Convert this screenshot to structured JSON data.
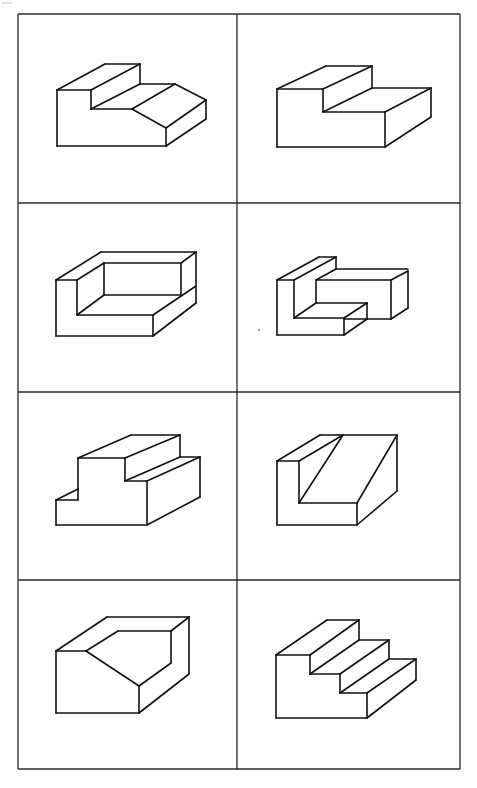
{
  "figure": {
    "type": "isometric-block-drawings-grid",
    "rows": 4,
    "columns": 2,
    "line_color": "#111111",
    "border_color": "#2a2a2a",
    "background": "#ffffff",
    "border": {
      "x1": 18,
      "y1": 14,
      "x2": 460,
      "y2": 769
    },
    "column_divider_x": 237,
    "row_divider_y": [
      203,
      392,
      580
    ]
  },
  "cells": [
    {
      "id": 1,
      "row": 1,
      "col": 1,
      "label": "stepped block with sloped front",
      "edges": [
        [
          57,
          90,
          57,
          146
        ],
        [
          57,
          146,
          166,
          146
        ],
        [
          57,
          90,
          91,
          90
        ],
        [
          91,
          90,
          91,
          109
        ],
        [
          91,
          109,
          132,
          109
        ],
        [
          132,
          109,
          166,
          128
        ],
        [
          166,
          128,
          166,
          146
        ],
        [
          57,
          90,
          105,
          64
        ],
        [
          105,
          64,
          140,
          64
        ],
        [
          91,
          90,
          140,
          64
        ],
        [
          140,
          64,
          140,
          84
        ],
        [
          91,
          109,
          140,
          84
        ],
        [
          140,
          84,
          175,
          84
        ],
        [
          132,
          109,
          175,
          84
        ],
        [
          175,
          84,
          206,
          100
        ],
        [
          166,
          128,
          206,
          100
        ],
        [
          206,
          100,
          206,
          119
        ],
        [
          166,
          146,
          206,
          119
        ]
      ]
    },
    {
      "id": 2,
      "row": 1,
      "col": 2,
      "label": "L-step block",
      "edges": [
        [
          277,
          89,
          277,
          147
        ],
        [
          277,
          147,
          385,
          147
        ],
        [
          277,
          89,
          323,
          89
        ],
        [
          323,
          89,
          323,
          112
        ],
        [
          323,
          112,
          385,
          112
        ],
        [
          385,
          112,
          385,
          147
        ],
        [
          277,
          89,
          326,
          66
        ],
        [
          326,
          66,
          372,
          66
        ],
        [
          323,
          89,
          372,
          66
        ],
        [
          372,
          66,
          372,
          88
        ],
        [
          323,
          112,
          372,
          88
        ],
        [
          372,
          88,
          431,
          88
        ],
        [
          385,
          112,
          431,
          88
        ],
        [
          431,
          88,
          431,
          117
        ],
        [
          385,
          147,
          431,
          117
        ]
      ]
    },
    {
      "id": 3,
      "row": 2,
      "col": 1,
      "label": "open box corner",
      "edges": [
        [
          56,
          280,
          56,
          336
        ],
        [
          56,
          336,
          153,
          336
        ],
        [
          56,
          280,
          77,
          280
        ],
        [
          77,
          280,
          77,
          315
        ],
        [
          77,
          315,
          153,
          315
        ],
        [
          153,
          315,
          153,
          336
        ],
        [
          56,
          280,
          101,
          252
        ],
        [
          101,
          252,
          196,
          252
        ],
        [
          77,
          280,
          104,
          263
        ],
        [
          104,
          263,
          181,
          263
        ],
        [
          104,
          263,
          104,
          295
        ],
        [
          77,
          315,
          104,
          295
        ],
        [
          104,
          295,
          181,
          295
        ],
        [
          181,
          263,
          181,
          295
        ],
        [
          181,
          263,
          196,
          252
        ],
        [
          153,
          315,
          196,
          286
        ],
        [
          196,
          252,
          196,
          303
        ],
        [
          153,
          336,
          196,
          303
        ]
      ]
    },
    {
      "id": 4,
      "row": 2,
      "col": 2,
      "label": "L-shaped interlocking block",
      "edges": [
        [
          277,
          280,
          277,
          335
        ],
        [
          277,
          335,
          344,
          335
        ],
        [
          277,
          280,
          294,
          280
        ],
        [
          294,
          280,
          294,
          318
        ],
        [
          294,
          318,
          344,
          318
        ],
        [
          344,
          318,
          344,
          335
        ],
        [
          277,
          280,
          319,
          257
        ],
        [
          319,
          257,
          336,
          257
        ],
        [
          294,
          280,
          336,
          257
        ],
        [
          336,
          257,
          336,
          269
        ],
        [
          316,
          280,
          316,
          303
        ],
        [
          316,
          280,
          391,
          280
        ],
        [
          336,
          269,
          408,
          269
        ],
        [
          316,
          280,
          336,
          269
        ],
        [
          391,
          280,
          408,
          271
        ],
        [
          391,
          280,
          391,
          319
        ],
        [
          408,
          271,
          408,
          308
        ],
        [
          391,
          319,
          408,
          308
        ],
        [
          344,
          319,
          391,
          319
        ],
        [
          316,
          303,
          367,
          303
        ],
        [
          294,
          318,
          316,
          303
        ],
        [
          344,
          318,
          367,
          303
        ],
        [
          367,
          303,
          367,
          319
        ],
        [
          344,
          335,
          367,
          319
        ]
      ]
    },
    {
      "id": 5,
      "row": 3,
      "col": 1,
      "label": "raised block with ledges",
      "edges": [
        [
          56,
          500,
          56,
          525
        ],
        [
          56,
          525,
          147,
          525
        ],
        [
          56,
          500,
          78,
          489
        ],
        [
          78,
          489,
          78,
          500
        ],
        [
          56,
          500,
          78,
          500
        ],
        [
          78,
          458,
          78,
          489
        ],
        [
          78,
          458,
          125,
          458
        ],
        [
          125,
          458,
          125,
          481
        ],
        [
          125,
          481,
          147,
          481
        ],
        [
          147,
          481,
          147,
          525
        ],
        [
          78,
          458,
          131,
          435
        ],
        [
          131,
          435,
          180,
          435
        ],
        [
          125,
          458,
          180,
          435
        ],
        [
          180,
          435,
          180,
          457
        ],
        [
          125,
          481,
          180,
          457
        ],
        [
          180,
          457,
          200,
          457
        ],
        [
          147,
          481,
          200,
          457
        ],
        [
          200,
          457,
          200,
          497
        ],
        [
          147,
          525,
          200,
          497
        ]
      ]
    },
    {
      "id": 6,
      "row": 3,
      "col": 2,
      "label": "block with diagonal cut",
      "edges": [
        [
          277,
          461,
          277,
          525
        ],
        [
          277,
          525,
          357,
          525
        ],
        [
          277,
          461,
          299,
          461
        ],
        [
          299,
          461,
          299,
          503
        ],
        [
          299,
          503,
          357,
          503
        ],
        [
          357,
          503,
          357,
          525
        ],
        [
          277,
          461,
          320,
          435
        ],
        [
          320,
          435,
          397,
          435
        ],
        [
          299,
          461,
          343,
          435
        ],
        [
          299,
          503,
          343,
          435
        ],
        [
          357,
          503,
          397,
          435
        ],
        [
          397,
          435,
          397,
          491
        ],
        [
          357,
          525,
          397,
          491
        ]
      ]
    },
    {
      "id": 7,
      "row": 4,
      "col": 1,
      "label": "block with chamfered notch",
      "edges": [
        [
          56,
          651,
          56,
          713
        ],
        [
          56,
          713,
          139,
          713
        ],
        [
          56,
          651,
          86,
          651
        ],
        [
          86,
          651,
          139,
          686
        ],
        [
          139,
          686,
          139,
          713
        ],
        [
          56,
          651,
          107,
          617
        ],
        [
          107,
          617,
          189,
          617
        ],
        [
          86,
          651,
          118,
          631
        ],
        [
          118,
          631,
          171,
          631
        ],
        [
          171,
          631,
          171,
          663
        ],
        [
          139,
          686,
          171,
          663
        ],
        [
          171,
          631,
          189,
          617
        ],
        [
          189,
          617,
          189,
          674
        ],
        [
          139,
          713,
          189,
          674
        ]
      ]
    },
    {
      "id": 8,
      "row": 4,
      "col": 2,
      "label": "three-step staircase",
      "edges": [
        [
          276,
          655,
          276,
          718
        ],
        [
          276,
          718,
          367,
          718
        ],
        [
          276,
          655,
          310,
          655
        ],
        [
          310,
          655,
          310,
          674
        ],
        [
          310,
          674,
          340,
          674
        ],
        [
          340,
          674,
          340,
          693
        ],
        [
          340,
          693,
          367,
          693
        ],
        [
          367,
          693,
          367,
          718
        ],
        [
          276,
          655,
          327,
          620
        ],
        [
          327,
          620,
          359,
          620
        ],
        [
          310,
          655,
          359,
          620
        ],
        [
          359,
          620,
          359,
          640
        ],
        [
          310,
          674,
          359,
          640
        ],
        [
          359,
          640,
          389,
          640
        ],
        [
          340,
          674,
          389,
          640
        ],
        [
          389,
          640,
          389,
          659
        ],
        [
          340,
          693,
          389,
          659
        ],
        [
          389,
          659,
          416,
          659
        ],
        [
          367,
          693,
          416,
          659
        ],
        [
          416,
          659,
          416,
          680
        ],
        [
          367,
          718,
          416,
          680
        ]
      ]
    }
  ],
  "artifacts": {
    "stray_dot": {
      "x": 259,
      "y": 330
    }
  }
}
